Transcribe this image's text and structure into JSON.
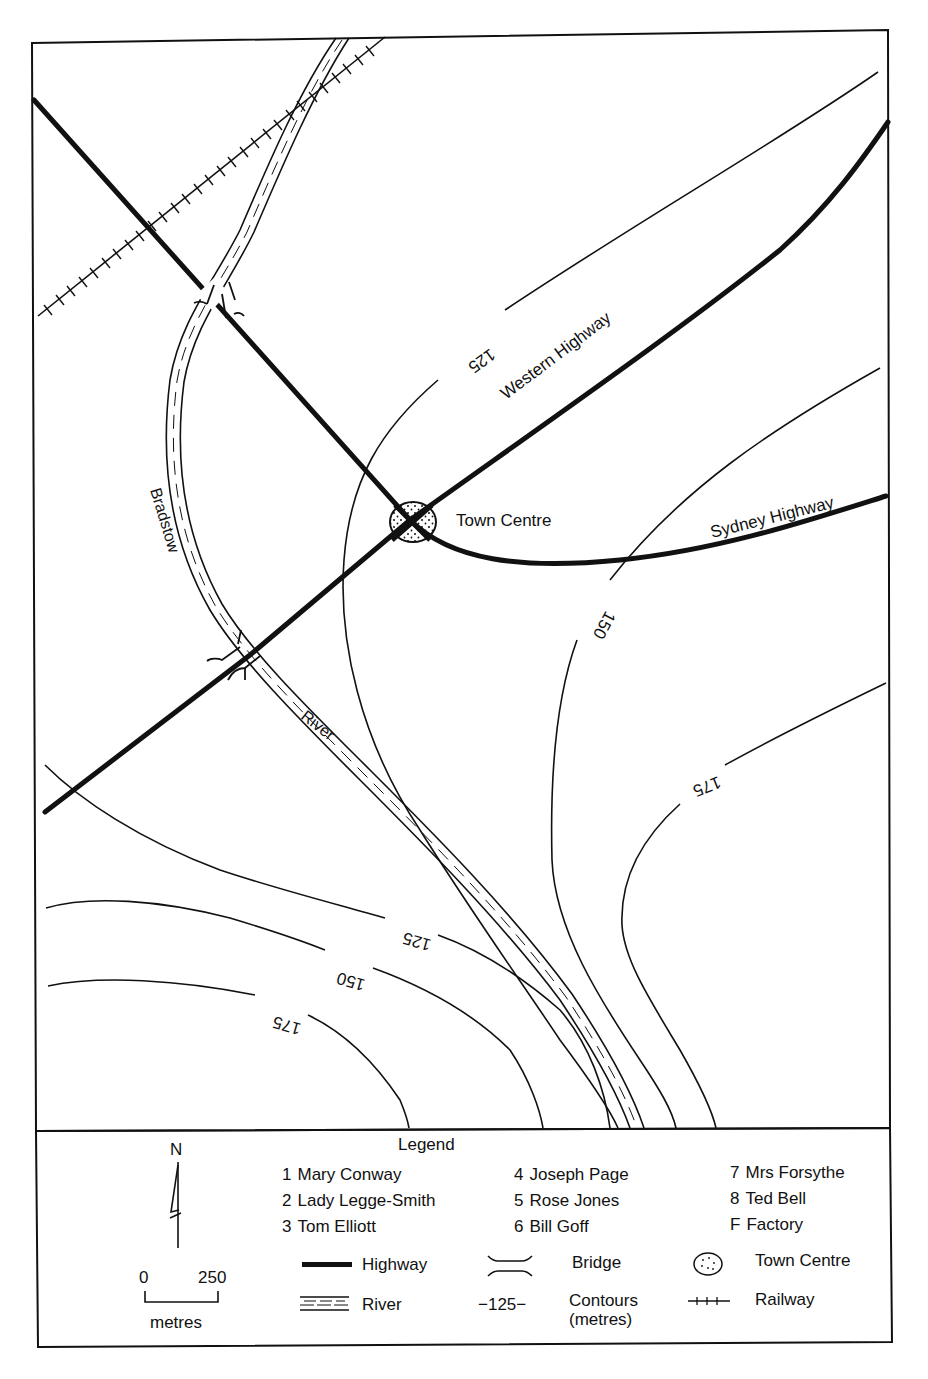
{
  "map": {
    "labels": {
      "western_highway": "Western Highway",
      "sydney_highway": "Sydney Highway",
      "town_centre": "Town Centre",
      "river_part1": "Bradstow",
      "river_part2": "River"
    },
    "contours": {
      "c125_top": "125",
      "c150_right": "150",
      "c175_right": "175",
      "c125_bottom": "125",
      "c150_bottom": "150",
      "c175_bottom": "175"
    },
    "colors": {
      "ink": "#111111",
      "paper": "#ffffff"
    }
  },
  "legend": {
    "title": "Legend",
    "north_label": "N",
    "scale": {
      "start": "0",
      "end": "250",
      "unit": "metres"
    },
    "people": [
      {
        "key": "1",
        "name": "Mary Conway"
      },
      {
        "key": "2",
        "name": "Lady Legge-Smith"
      },
      {
        "key": "3",
        "name": "Tom Elliott"
      },
      {
        "key": "4",
        "name": "Joseph Page"
      },
      {
        "key": "5",
        "name": "Rose Jones"
      },
      {
        "key": "6",
        "name": "Bill Goff"
      },
      {
        "key": "7",
        "name": "Mrs Forsythe"
      },
      {
        "key": "8",
        "name": "Ted Bell"
      },
      {
        "key": "F",
        "name": "Factory"
      }
    ],
    "symbols": {
      "highway": "Highway",
      "bridge": "Bridge",
      "town_centre": "Town Centre",
      "river": "River",
      "contour_sample": "−125−",
      "contours": "Contours",
      "contours_unit": "(metres)",
      "railway": "Railway"
    }
  }
}
